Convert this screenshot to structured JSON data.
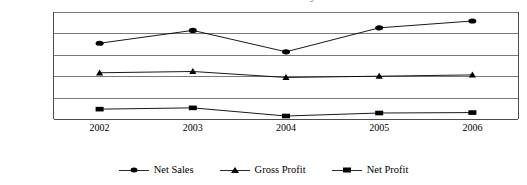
{
  "title_fragment": "Sales and Profitability",
  "chart_data": {
    "type": "line",
    "title": "",
    "xlabel": "",
    "ylabel": "",
    "categories": [
      "2002",
      "2003",
      "2004",
      "2005",
      "2006"
    ],
    "x": [
      2002,
      2003,
      2004,
      2005,
      2006
    ],
    "ylim": [
      0,
      250000
    ],
    "y_ticks": [
      0,
      50000,
      100000,
      150000,
      200000,
      250000
    ],
    "y_tick_labels": [
      "0",
      "50,000",
      "100,000",
      "150,000",
      "200,000",
      "250,000"
    ],
    "y_minor_ticks": [
      25000,
      75000,
      125000,
      175000,
      225000
    ],
    "grid": true,
    "grid_axis": "y",
    "legend_position": "bottom",
    "series": [
      {
        "name": "Net Sales",
        "marker": "circle",
        "color": "#000000",
        "values": [
          177000,
          207000,
          157000,
          213000,
          229000
        ]
      },
      {
        "name": "Gross Profit",
        "marker": "triangle",
        "color": "#000000",
        "values": [
          108000,
          111000,
          97000,
          100000,
          103000
        ]
      },
      {
        "name": "Net Profit",
        "marker": "square",
        "color": "#000000",
        "values": [
          23000,
          26000,
          7000,
          14000,
          15000
        ]
      }
    ]
  },
  "legend": {
    "items": [
      {
        "label": "Net Sales",
        "marker": "circle"
      },
      {
        "label": "Gross Profit",
        "marker": "triangle"
      },
      {
        "label": "Net Profit",
        "marker": "square"
      }
    ]
  }
}
